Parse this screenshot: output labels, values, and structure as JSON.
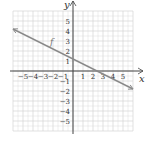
{
  "chart_data": {
    "type": "line",
    "title": "",
    "xlabel": "x",
    "ylabel": "y",
    "xlim": [
      -6,
      6
    ],
    "ylim": [
      -6,
      6
    ],
    "grid": true,
    "x_ticks": [
      "-5",
      "-4",
      "-3",
      "-2",
      "-1",
      "1",
      "2",
      "3",
      "4",
      "5"
    ],
    "y_ticks": [
      "5",
      "4",
      "3",
      "2",
      "1",
      "-1",
      "-2",
      "-3",
      "-4",
      "-5"
    ],
    "series": [
      {
        "name": "f",
        "equation_estimate": "y = -0.5x + 1.2",
        "x": [
          -6,
          6
        ],
        "y": [
          4.2,
          -1.8
        ],
        "arrows": "both",
        "color": "#8a8a8a"
      }
    ],
    "annotations": [
      {
        "text": "f",
        "x": -2.3,
        "y": 2.6
      }
    ]
  },
  "colors": {
    "grid": "#d4d4d4",
    "axis": "#444444",
    "line": "#8a8a8a"
  }
}
